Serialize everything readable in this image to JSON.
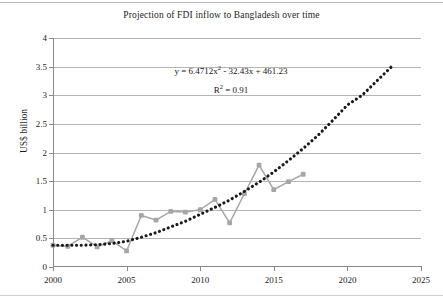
{
  "chart_data": {
    "type": "line",
    "title": "Projection of FDI inflow to Bangladesh over time",
    "xlabel": "",
    "ylabel": "US$ billion",
    "xlim": [
      2000,
      2025
    ],
    "ylim": [
      0,
      4
    ],
    "ytick_labels": [
      "0",
      "0.5",
      "1",
      "1.5",
      "2",
      "2.5",
      "3",
      "3.5",
      "4"
    ],
    "ytick_values": [
      0,
      0.5,
      1,
      1.5,
      2,
      2.5,
      3,
      3.5,
      4
    ],
    "xtick_labels": [
      "2000",
      "2005",
      "2010",
      "2015",
      "2020",
      "2025"
    ],
    "xtick_values": [
      2000,
      2005,
      2010,
      2015,
      2020,
      2025
    ],
    "grid": "horizontal",
    "legend": "none",
    "annotations": {
      "equation": "y = 6.4712x² - 32.43x + 461.23",
      "equation_prefix": "y = 6.4712x",
      "equation_exponent": "2",
      "equation_suffix": " - 32.43x + 461.23",
      "r_squared_prefix": "R",
      "r_squared_exponent": "2",
      "r_squared_suffix": " = 0.91",
      "r_squared": "R² = 0.91"
    },
    "series": [
      {
        "name": "FDI inflow (actual)",
        "style": "line-with-markers",
        "color": "#a6a6a6",
        "x": [
          2000,
          2001,
          2002,
          2003,
          2004,
          2005,
          2006,
          2007,
          2008,
          2009,
          2010,
          2011,
          2012,
          2013,
          2014,
          2015,
          2016,
          2017
        ],
        "values": [
          0.38,
          0.36,
          0.52,
          0.35,
          0.46,
          0.28,
          0.9,
          0.82,
          0.97,
          0.96,
          1.0,
          1.18,
          0.77,
          1.28,
          1.78,
          1.35,
          1.49,
          1.62
        ]
      },
      {
        "name": "Polynomial trendline (projection)",
        "style": "dotted",
        "color": "#1a1a1a",
        "x": [
          2000,
          2001,
          2002,
          2003,
          2004,
          2005,
          2006,
          2007,
          2008,
          2009,
          2010,
          2011,
          2012,
          2013,
          2014,
          2015,
          2016,
          2017,
          2018,
          2019,
          2020,
          2021,
          2022,
          2023
        ],
        "values": [
          0.38,
          0.38,
          0.38,
          0.39,
          0.41,
          0.45,
          0.52,
          0.6,
          0.7,
          0.8,
          0.92,
          1.04,
          1.17,
          1.32,
          1.48,
          1.66,
          1.86,
          2.07,
          2.3,
          2.56,
          2.83,
          3.0,
          3.25,
          3.5
        ]
      }
    ]
  }
}
